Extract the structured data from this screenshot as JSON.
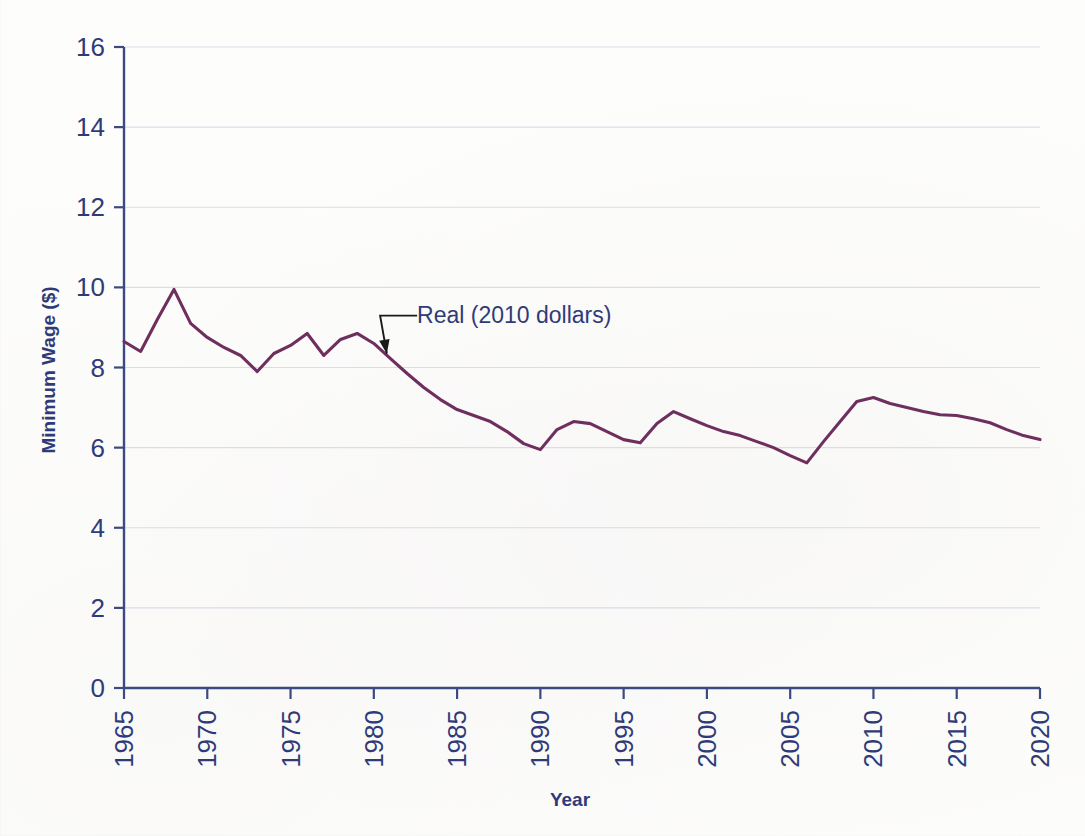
{
  "chart_data": {
    "type": "line",
    "title": "",
    "xlabel": "Year",
    "ylabel": "Minimum Wage ($)",
    "xlim": [
      1965,
      2020
    ],
    "ylim": [
      0,
      16
    ],
    "xticks": [
      1965,
      1970,
      1975,
      1980,
      1985,
      1990,
      1995,
      2000,
      2005,
      2010,
      2015,
      2020
    ],
    "yticks": [
      0,
      2,
      4,
      6,
      8,
      10,
      12,
      14,
      16
    ],
    "xtick_labels": [
      "1965",
      "1970",
      "1975",
      "1980",
      "1985",
      "1990",
      "1995",
      "2000",
      "2005",
      "2010",
      "2015",
      "2020"
    ],
    "ytick_labels": [
      "0",
      "2",
      "4",
      "6",
      "8",
      "10",
      "12",
      "14",
      "16"
    ],
    "grid": "horizontal",
    "legend": "none",
    "xtick_rotation": 90,
    "annotations": [
      {
        "text": "Real (2010 dollars)",
        "text_x": 1982.6,
        "text_y": 9.12,
        "point_x": 1980.6,
        "point_y": 8.22
      }
    ],
    "series": [
      {
        "name": "Real (2010 dollars)",
        "color": "#6e2f5e",
        "x": [
          1965,
          1966,
          1967,
          1968,
          1969,
          1970,
          1971,
          1972,
          1973,
          1974,
          1975,
          1976,
          1977,
          1978,
          1979,
          1980,
          1981,
          1982,
          1983,
          1984,
          1985,
          1986,
          1987,
          1988,
          1989,
          1990,
          1991,
          1992,
          1993,
          1994,
          1995,
          1996,
          1997,
          1998,
          1999,
          2000,
          2001,
          2002,
          2003,
          2004,
          2005,
          2006,
          2007,
          2008,
          2009,
          2010,
          2011,
          2012,
          2013,
          2014,
          2015,
          2016,
          2017,
          2018,
          2019,
          2020
        ],
        "y": [
          8.65,
          8.4,
          9.2,
          9.95,
          9.1,
          8.75,
          8.5,
          8.3,
          7.9,
          8.35,
          8.55,
          8.85,
          8.3,
          8.7,
          8.85,
          8.6,
          8.22,
          7.85,
          7.5,
          7.2,
          6.95,
          6.8,
          6.65,
          6.4,
          6.1,
          5.95,
          6.45,
          6.65,
          6.6,
          6.4,
          6.2,
          6.12,
          6.6,
          6.9,
          6.72,
          6.55,
          6.4,
          6.3,
          6.15,
          6.0,
          5.8,
          5.62,
          6.15,
          6.65,
          7.15,
          7.25,
          7.1,
          7.0,
          6.9,
          6.82,
          6.8,
          6.72,
          6.62,
          6.45,
          6.3,
          6.2
        ]
      }
    ]
  }
}
